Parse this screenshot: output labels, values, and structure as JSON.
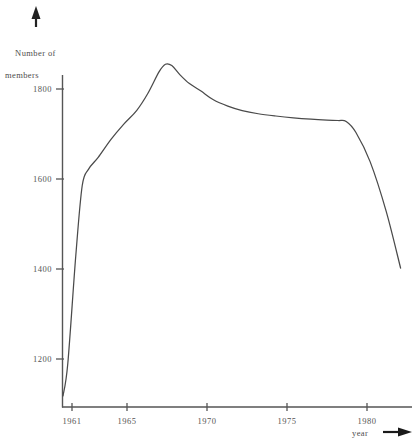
{
  "figure": {
    "background_color": "#ffffff",
    "line_color": "#4a4a4a",
    "axis_color": "#555555"
  },
  "axes": {
    "y_title_line1": "Number of",
    "y_title_line2": "members",
    "x_title": "year",
    "y_arrow_icon": "up-arrow-icon",
    "x_arrow_icon": "right-arrow-icon"
  },
  "chart_data": {
    "type": "line",
    "title": "",
    "subtitle": "",
    "xlabel": "year",
    "ylabel": "Number of members",
    "xlim": [
      1960.4,
      1982.2
    ],
    "ylim": [
      1100,
      1900
    ],
    "grid": false,
    "legend": null,
    "x_ticks": [
      1961,
      1965,
      1970,
      1975,
      1980
    ],
    "x_tick_labels": [
      "1961",
      "1965",
      "1970",
      "1975",
      "1980"
    ],
    "y_ticks": [
      1200,
      1400,
      1600,
      1800
    ],
    "y_tick_labels": [
      "1200",
      "1400",
      "1600",
      "1800"
    ],
    "series": [
      {
        "name": "Number of members",
        "x": [
          1961.0,
          1961.3,
          1961.8,
          1962.2,
          1962.6,
          1963.2,
          1964.0,
          1964.8,
          1965.6,
          1966.3,
          1967.0,
          1967.4,
          1967.8,
          1968.3,
          1968.9,
          1969.6,
          1970.4,
          1971.3,
          1972.2,
          1973.2,
          1974.3,
          1975.4,
          1976.5,
          1977.5,
          1978.2,
          1978.7,
          1979.3,
          1980.2,
          1981.2,
          1982.1
        ],
        "values": [
          1118,
          1190,
          1430,
          1585,
          1622,
          1648,
          1688,
          1722,
          1752,
          1790,
          1838,
          1855,
          1852,
          1832,
          1812,
          1796,
          1776,
          1762,
          1752,
          1745,
          1740,
          1736,
          1733,
          1731,
          1730,
          1728,
          1704,
          1638,
          1528,
          1402
        ]
      }
    ]
  }
}
